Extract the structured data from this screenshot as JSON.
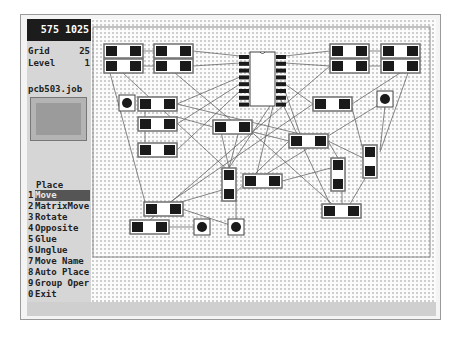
{
  "status": {
    "x": "575",
    "y": "1025"
  },
  "params": [
    {
      "label": "Grid",
      "value": "25"
    },
    {
      "label": "Level",
      "value": "1"
    }
  ],
  "job": {
    "filename": "pcb503.job"
  },
  "menu": {
    "title": "Place",
    "items": [
      {
        "key": "1",
        "label": "Move",
        "selected": true
      },
      {
        "key": "2",
        "label": "MatrixMove"
      },
      {
        "key": "3",
        "label": "Rotate"
      },
      {
        "key": "4",
        "label": "Opposite"
      },
      {
        "key": "5",
        "label": "Glue"
      },
      {
        "key": "6",
        "label": "Unglue"
      },
      {
        "key": "7",
        "label": "Move Name"
      },
      {
        "key": "8",
        "label": "Auto Place"
      },
      {
        "key": "9",
        "label": "Group Oper"
      },
      {
        "key": "0",
        "label": "Exit"
      }
    ]
  },
  "board": {
    "outline": {
      "x": 93,
      "y": 27,
      "w": 337,
      "h": 230
    },
    "ic": {
      "name": "DIP16",
      "x": 250,
      "y": 52,
      "w": 25,
      "h": 54,
      "pins_per_side": 8
    },
    "components_h": [
      [
        104,
        44
      ],
      [
        104,
        59
      ],
      [
        154,
        44
      ],
      [
        154,
        59
      ],
      [
        330,
        44
      ],
      [
        330,
        59
      ],
      [
        381,
        44
      ],
      [
        381,
        59
      ],
      [
        138,
        97
      ],
      [
        138,
        117
      ],
      [
        138,
        143
      ],
      [
        213,
        120
      ],
      [
        313,
        97
      ],
      [
        289,
        134
      ],
      [
        243,
        174
      ],
      [
        144,
        202
      ],
      [
        130,
        220
      ],
      [
        322,
        204
      ]
    ],
    "components_v": [
      [
        222,
        168
      ],
      [
        331,
        158
      ],
      [
        363,
        145
      ]
    ],
    "vias": [
      [
        127,
        103
      ],
      [
        385,
        99
      ],
      [
        202,
        227
      ],
      [
        236,
        227
      ]
    ],
    "colors": {
      "pad": "#1a1a1a",
      "outline": "#707070",
      "ratsnest": "#555555"
    }
  }
}
